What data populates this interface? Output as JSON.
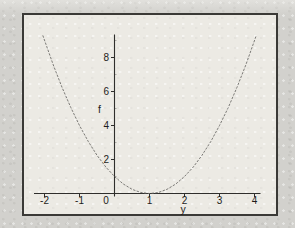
{
  "figure": {
    "outer_background": "#d2d1cd",
    "plot_background": "#eceae4",
    "frame_border_color": "#3a3936",
    "axis_color": "#2f2e2c",
    "curve_color": "#6e6d6a",
    "text_color": "#1e1d1b"
  },
  "chart_data": {
    "type": "line",
    "title": "",
    "xlabel": "y",
    "ylabel": "f",
    "xlim": [
      -2.3,
      4.2
    ],
    "ylim": [
      0,
      9.5
    ],
    "grid": false,
    "legend": false,
    "x_tick_values": [
      -2,
      -1,
      0,
      1,
      2,
      3,
      4
    ],
    "x_tick_labels": [
      "-2",
      "-1",
      "0",
      "1",
      "2",
      "3",
      "4"
    ],
    "y_tick_values": [
      2,
      4,
      6,
      8
    ],
    "y_tick_labels": [
      "2",
      "4",
      "6",
      "8"
    ],
    "y_minor_tick_values": [
      1,
      3,
      5,
      7,
      9
    ],
    "series": [
      {
        "name": "parabola",
        "style": "dotted",
        "x": [
          -2.05,
          -1.75,
          -1.5,
          -1.25,
          -1.0,
          -0.75,
          -0.5,
          -0.25,
          0.0,
          0.25,
          0.5,
          0.75,
          1.0,
          1.25,
          1.5,
          1.75,
          2.0,
          2.25,
          2.5,
          2.75,
          3.0,
          3.25,
          3.5,
          3.75,
          4.05
        ],
        "y": [
          9.3,
          7.56,
          6.25,
          5.06,
          4.0,
          3.06,
          2.25,
          1.56,
          1.0,
          0.56,
          0.25,
          0.06,
          0.0,
          0.06,
          0.25,
          0.56,
          1.0,
          1.56,
          2.25,
          3.06,
          4.0,
          5.06,
          6.25,
          7.56,
          9.3
        ]
      }
    ]
  }
}
